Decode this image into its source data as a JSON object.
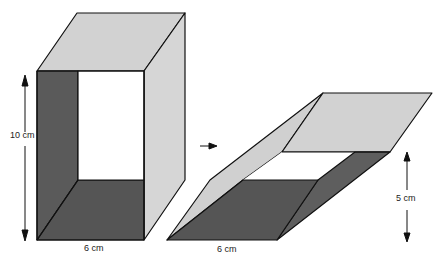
{
  "diagram": {
    "left_box": {
      "height_label": "10 cm",
      "width_label": "6 cm"
    },
    "right_box": {
      "height_label": "5 cm",
      "width_label": "6 cm"
    },
    "colors": {
      "light_face": "#d2d2d2",
      "dark_face": "#585858",
      "outline": "#111111",
      "background": "#ffffff"
    }
  }
}
